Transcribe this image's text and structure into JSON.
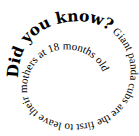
{
  "spiral": {
    "heading": "Did you know?",
    "body": " Giant panda cubs are the first to leave their mothers at 18 months old",
    "text_color": "#000000",
    "background_color": "#ffffff"
  }
}
